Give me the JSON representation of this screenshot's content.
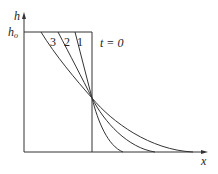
{
  "diagram": {
    "axes": {
      "y_label": "h",
      "x_label": "x",
      "h0_label": "h",
      "h0_subscript": "o"
    },
    "curves": [
      {
        "label": "1"
      },
      {
        "label": "2"
      },
      {
        "label": "3"
      }
    ],
    "initial_label": "t = 0",
    "colors": {
      "line": "#333333",
      "background": "#ffffff"
    }
  }
}
